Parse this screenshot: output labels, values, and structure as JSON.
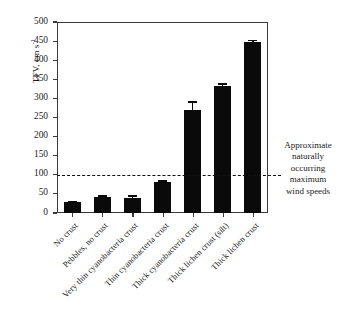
{
  "chart_data": {
    "type": "bar",
    "title": "",
    "xlabel": "",
    "ylabel": "TFV, cm s",
    "ylabel_exponent": "-1",
    "ylim": [
      0,
      500
    ],
    "yticks": [
      0,
      50,
      100,
      150,
      200,
      250,
      300,
      350,
      400,
      450,
      500
    ],
    "ytick_labels": [
      "0",
      "50",
      "100",
      "150",
      "200",
      "250",
      "300",
      "350",
      "400",
      "450",
      "500"
    ],
    "grid": false,
    "legend": null,
    "categories": [
      "No crust",
      "Pebbles, no crust",
      "Very thin cyanobacteria crust",
      "Thin cyanobacteria crust",
      "Thick cyanobacteria crust",
      "Thick lichen crust (silt)",
      "Thick lichen crust"
    ],
    "values": [
      28,
      43,
      40,
      82,
      270,
      333,
      447
    ],
    "errors": [
      4,
      3,
      6,
      4,
      22,
      7,
      6
    ],
    "bar_color": "#0a0a0a",
    "annotations": [
      {
        "name": "threshold-line",
        "type": "hline",
        "y": 100,
        "style": "dashed",
        "color": "#111111",
        "text_lines": [
          "Approximate",
          "naturally",
          "occurring",
          "maximum",
          "wind speeds"
        ]
      }
    ]
  }
}
